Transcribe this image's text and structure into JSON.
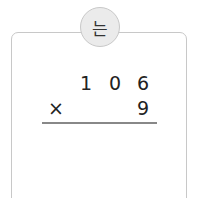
{
  "badge": {
    "label": "는"
  },
  "problem": {
    "multiplicand_digits": [
      "1",
      "0",
      "6"
    ],
    "operator": "×",
    "multiplier_digits": [
      "9"
    ]
  }
}
